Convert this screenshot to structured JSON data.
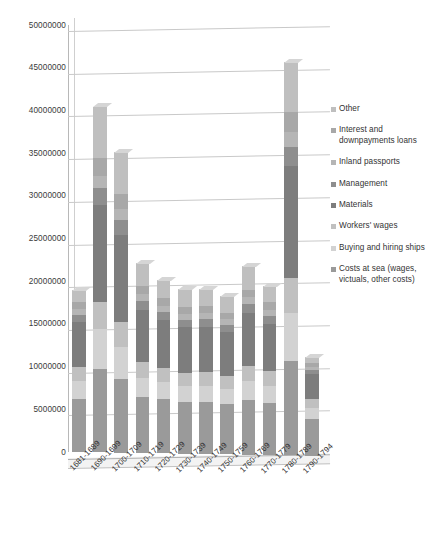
{
  "chart_data": {
    "type": "bar",
    "subtype": "stacked-column-3d",
    "title": "",
    "xlabel": "",
    "ylabel": "",
    "ylim": [
      0,
      50000000
    ],
    "ytick_step": 5000000,
    "grid": true,
    "legend_position": "right",
    "ytick_labels": [
      "50000000",
      "45000000",
      "40000000",
      "35000000",
      "30000000",
      "25000000",
      "20000000",
      "15000000",
      "10000000",
      "5000000",
      "0"
    ],
    "categories": [
      "1681-1689",
      "1690-1699",
      "1700-1709",
      "1710-1719",
      "1720-1729",
      "1730-1739",
      "1740-1749",
      "1750-1759",
      "1760-1769",
      "1770-1779",
      "1780-1789",
      "1790-1794"
    ],
    "series": [
      {
        "name": "Costs at sea (wages, victuals, other costs)",
        "color": "#9a9a9a",
        "values": [
          6200000,
          9800000,
          8600000,
          6500000,
          6300000,
          6000000,
          6100000,
          5900000,
          6400000,
          6100000,
          11000000,
          4300000
        ]
      },
      {
        "name": "Buying and hiring ships",
        "color": "#d2d2d2",
        "values": [
          2100000,
          4600000,
          3800000,
          2300000,
          2000000,
          1900000,
          1900000,
          1800000,
          2200000,
          2000000,
          5600000,
          1300000
        ]
      },
      {
        "name": "Workers' wages",
        "color": "#c0c0c0",
        "values": [
          1600000,
          3200000,
          2900000,
          1900000,
          1700000,
          1600000,
          1600000,
          1500000,
          1800000,
          1700000,
          4100000,
          1000000
        ]
      },
      {
        "name": "Materials",
        "color": "#7d7d7d",
        "values": [
          5300000,
          11400000,
          10200000,
          6100000,
          5600000,
          5300000,
          5300000,
          5100000,
          6200000,
          5500000,
          13200000,
          2900000
        ]
      },
      {
        "name": "Management",
        "color": "#8e8e8e",
        "values": [
          900000,
          1900000,
          1700000,
          1000000,
          950000,
          900000,
          900000,
          850000,
          1000000,
          950000,
          2200000,
          500000
        ]
      },
      {
        "name": "Inland passports",
        "color": "#b5b5b5",
        "values": [
          700000,
          1500000,
          1300000,
          800000,
          750000,
          700000,
          700000,
          650000,
          800000,
          750000,
          1700000,
          400000
        ]
      },
      {
        "name": "Interest and downpayments loans",
        "color": "#a8a8a8",
        "values": [
          800000,
          2100000,
          1800000,
          900000,
          850000,
          800000,
          800000,
          750000,
          900000,
          850000,
          2400000,
          450000
        ]
      },
      {
        "name": "Other",
        "color": "#bfbfbf",
        "values": [
          1400000,
          6000000,
          4900000,
          2800000,
          2100000,
          2100000,
          2000000,
          1950000,
          2800000,
          1900000,
          5800000,
          650000
        ]
      }
    ],
    "totals": [
      19000000,
      40500000,
      35200000,
      22300000,
      20200000,
      19300000,
      19300000,
      18500000,
      22100000,
      19700000,
      46000000,
      11500000
    ]
  },
  "legend": {
    "items": [
      {
        "label": "Other",
        "color": "#bfbfbf"
      },
      {
        "label": "Interest and downpayments loans",
        "color": "#a8a8a8"
      },
      {
        "label": "Inland passports",
        "color": "#b5b5b5"
      },
      {
        "label": "Management",
        "color": "#8e8e8e"
      },
      {
        "label": "Materials",
        "color": "#7d7d7d"
      },
      {
        "label": "Workers' wages",
        "color": "#c0c0c0"
      },
      {
        "label": "Buying and hiring ships",
        "color": "#d2d2d2"
      },
      {
        "label": "Costs at sea (wages, victuals, other costs)",
        "color": "#9a9a9a"
      }
    ]
  },
  "colors": {
    "background": "#ffffff",
    "gridline": "#c9c9c9",
    "axis": "#b0b0b0",
    "text": "#333333"
  }
}
